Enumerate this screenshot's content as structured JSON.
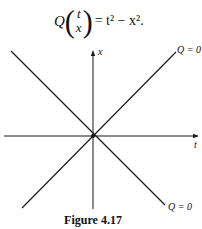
{
  "equation": {
    "lhs_symbol": "Q",
    "vector_top": "t",
    "vector_bottom": "x",
    "open_paren": "(",
    "close_paren": ")",
    "rhs": "= t² − x².",
    "latex": "Q\\begin{pmatrix} t \\\\ x \\end{pmatrix} = t^2 - x^2."
  },
  "diagram": {
    "axes": {
      "horizontal_label": "t",
      "vertical_label": "x",
      "origin": [
        93,
        136
      ]
    },
    "lines": [
      {
        "name": "line-t-equals-x",
        "from": [
          22,
          208
        ],
        "to": [
          176,
          52
        ],
        "label": "Q = 0"
      },
      {
        "name": "line-t-equals-minus-x",
        "from": [
          11,
          51
        ],
        "to": [
          165,
          205
        ],
        "label": "Q = 0"
      }
    ],
    "upper_label": "Q = 0",
    "lower_label": "Q = 0",
    "stroke_color": "#1a1a1a"
  },
  "caption": "Figure 4.17"
}
